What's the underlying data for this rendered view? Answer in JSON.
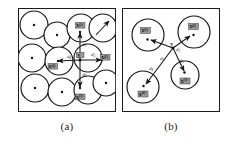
{
  "figure": {
    "panels": [
      {
        "id": "a",
        "caption": "(a)",
        "description": "Packed circles with overlapping neighborhoods and a central point connected by distance vectors to four neighbors",
        "frame": {
          "x": 18,
          "y": 8,
          "width": 98,
          "height": 104
        },
        "circles": [
          {
            "cx": 16,
            "cy": 17,
            "r": 14,
            "center_dot": true
          },
          {
            "cx": 39,
            "cy": 27,
            "r": 13,
            "center_dot": true
          },
          {
            "cx": 63,
            "cy": 20,
            "r": 14,
            "center_dot": true
          },
          {
            "cx": 85,
            "cy": 20,
            "r": 14,
            "center_dot": false
          },
          {
            "cx": 14,
            "cy": 50,
            "r": 14,
            "center_dot": true
          },
          {
            "cx": 41,
            "cy": 53,
            "r": 14,
            "center_dot": false
          },
          {
            "cx": 70,
            "cy": 50,
            "r": 14,
            "center_dot": false
          },
          {
            "cx": 17,
            "cy": 80,
            "r": 14,
            "center_dot": true
          },
          {
            "cx": 44,
            "cy": 84,
            "r": 14,
            "center_dot": true
          },
          {
            "cx": 70,
            "cy": 82,
            "r": 14,
            "center_dot": false
          },
          {
            "cx": 88,
            "cy": 75,
            "r": 13,
            "center_dot": true
          }
        ],
        "center_node": {
          "cx": 62,
          "cy": 52,
          "label": "y"
        },
        "neighbors": [
          {
            "label": "x",
            "superscript": "(1)",
            "x": 62,
            "y": 20,
            "direction": "up"
          },
          {
            "label": "x",
            "superscript": "(2)",
            "x": 87,
            "y": 52,
            "direction": "right"
          },
          {
            "label": "x",
            "superscript": "(3)",
            "x": 62,
            "y": 84,
            "direction": "down"
          },
          {
            "label": "x",
            "superscript": "(4)",
            "x": 36,
            "y": 54,
            "direction": "left"
          }
        ],
        "distance_labels": [
          {
            "text": "d",
            "subscript": "1",
            "x": 64.5,
            "y": 36
          },
          {
            "text": "d",
            "subscript": "2",
            "x": 74,
            "y": 48
          },
          {
            "text": "d",
            "subscript": "3",
            "x": 65,
            "y": 67
          },
          {
            "text": "d",
            "subscript": "4",
            "x": 51,
            "y": 48
          }
        ],
        "stray_arrow": {
          "x1": 78,
          "y1": 27,
          "x2": 91,
          "y2": 13
        }
      },
      {
        "id": "b",
        "caption": "(b)",
        "description": "Four sparse circles with a central point connected by distance vectors to three neighbor points",
        "frame": {
          "x": 122,
          "y": 8,
          "width": 98,
          "height": 104
        },
        "circles": [
          {
            "cx": 26,
            "cy": 27,
            "r": 16,
            "center_dot": false
          },
          {
            "cx": 72,
            "cy": 24,
            "r": 16,
            "center_dot": false
          },
          {
            "cx": 21,
            "cy": 79,
            "r": 16,
            "center_dot": false
          },
          {
            "cx": 63,
            "cy": 67,
            "r": 14,
            "center_dot": false
          }
        ],
        "center_node": {
          "cx": 51,
          "cy": 40,
          "label": "y"
        },
        "neighbors": [
          {
            "label": "x",
            "superscript": "(1)",
            "x": 24,
            "y": 30,
            "direction": "left-up"
          },
          {
            "label": "x",
            "superscript": "(2)",
            "x": 71,
            "y": 26,
            "direction": "right-up"
          },
          {
            "label": "x",
            "superscript": "(3)",
            "x": 61,
            "y": 70,
            "direction": "down-right"
          },
          {
            "label": "x",
            "superscript": "(4)",
            "x": 20,
            "y": 80,
            "direction": "left-down"
          }
        ],
        "distance_labels": [
          {
            "text": "d",
            "subscript": "1",
            "x": 40,
            "y": 51
          },
          {
            "text": "d",
            "subscript": "2",
            "x": 55,
            "y": 42
          },
          {
            "text": "d",
            "subscript": "3",
            "x": 58,
            "y": 53
          },
          {
            "text": "d",
            "subscript": "4",
            "x": 29,
            "y": 61
          }
        ]
      }
    ]
  },
  "colors": {
    "stroke": "#141414",
    "fill": "#ffffff",
    "tag_fill": "#9a9a9a",
    "text": "#111111",
    "background": "#ffffff"
  }
}
